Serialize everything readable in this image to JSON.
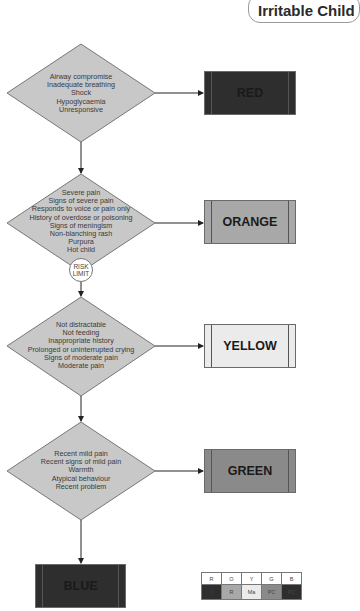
{
  "title": "Irritable Child",
  "colors": {
    "diamond_fill": "#c8c8c8",
    "red": "#2e2e2e",
    "orange": "#a8a8a8",
    "yellow": "#ebebeb",
    "green": "#8a8a8a",
    "blue": "#2e2e2e"
  },
  "discriminators": [
    {
      "lines": [
        "Airway compromise",
        "Inadequate breathing",
        "Shock",
        "Hypoglycaemia",
        "Unresponsive"
      ],
      "outcome": "RED"
    },
    {
      "lines": [
        "Severe pain",
        "Signs of severe pain",
        "Responds to voice or pain only",
        "History of overdose or poisoning",
        "Signs of meningism",
        "Non-blanching rash",
        "Purpura",
        "Hot child"
      ],
      "outcome": "ORANGE"
    },
    {
      "lines": [
        "Not distractable",
        "Not feeding",
        "Inappropriate history",
        "Prolonged or uninterrupted crying",
        "Signs of moderate pain",
        "Moderate pain"
      ],
      "outcome": "YELLOW"
    },
    {
      "lines": [
        "Recent mild pain",
        "Recent signs of mild pain",
        "Warmth",
        "Atypical behaviour",
        "Recent problem"
      ],
      "outcome": "GREEN"
    }
  ],
  "default_outcome": "BLUE",
  "risk_limit": {
    "line1": "RISK",
    "line2": "LIMIT"
  },
  "legend": {
    "headers": [
      "R",
      "O",
      "Y",
      "G",
      "B"
    ],
    "codes": [
      "I",
      "R",
      "Ma",
      "PC",
      "PC"
    ]
  }
}
